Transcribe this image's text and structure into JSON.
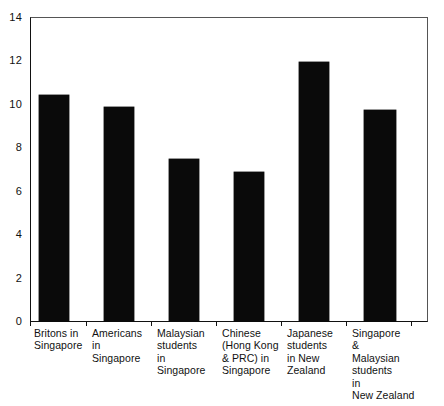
{
  "chart_data": {
    "type": "bar",
    "title": "",
    "xlabel": "",
    "ylabel": "",
    "ylim": [
      0,
      14
    ],
    "grid": false,
    "legend": null,
    "orientation": "vertical",
    "bar_color": "#0a0a0a",
    "axis_color": "#111111",
    "categories": [
      "Britons in Singapore",
      "Americans in Singapore",
      "Malaysian students in Singapore",
      "Chinese (Hong Kong & PRC) in Singapore",
      "Japanese students in New Zealand",
      "Singapore & Malaysian students in New Zealand"
    ],
    "category_lines": [
      [
        "Britons in",
        "Singapore"
      ],
      [
        "Americans",
        "in",
        "Singapore"
      ],
      [
        "Malaysian",
        "students",
        "in",
        "Singapore"
      ],
      [
        "Chinese",
        "(Hong Kong",
        "& PRC) in",
        "Singapore"
      ],
      [
        "Japanese",
        "students",
        "in New",
        "Zealand"
      ],
      [
        "Singapore",
        "&",
        "Malaysian",
        "students",
        "in",
        "New Zealand"
      ]
    ],
    "values": [
      10.4,
      9.85,
      7.45,
      6.85,
      11.95,
      9.7
    ],
    "y_ticks": [
      0,
      2,
      4,
      6,
      8,
      10,
      12,
      14
    ],
    "y_tick_labels": [
      "0",
      "2",
      "4",
      "6",
      "8",
      "10",
      "12",
      "14"
    ]
  }
}
